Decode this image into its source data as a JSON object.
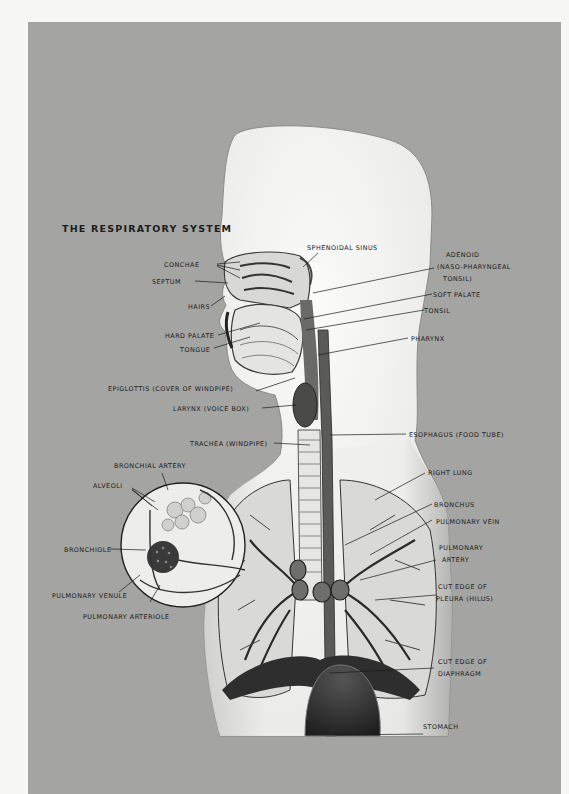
{
  "title": "THE RESPIRATORY SYSTEM",
  "colors": {
    "page_background": "#f7f7f5",
    "panel_background": "#a4a4a2",
    "text": "#1a1a1a",
    "body_fill": "#ececea",
    "tissue_dark": "#2a2a2a"
  },
  "labels": {
    "left": [
      {
        "id": "conchae",
        "text": "CONCHAE"
      },
      {
        "id": "septum",
        "text": "SEPTUM"
      },
      {
        "id": "hairs",
        "text": "HAIRS"
      },
      {
        "id": "hard_palate",
        "text": "HARD PALATE"
      },
      {
        "id": "tongue",
        "text": "TONGUE"
      },
      {
        "id": "epiglottis",
        "text": "EPIGLOTTIS (COVER OF WINDPIPE)"
      },
      {
        "id": "larynx",
        "text": "LARYNX (VOICE BOX)"
      },
      {
        "id": "trachea",
        "text": "TRACHEA (WINDPIPE)"
      },
      {
        "id": "bronchial_artery",
        "text": "BRONCHIAL ARTERY"
      },
      {
        "id": "alveoli",
        "text": "ALVEOLI"
      },
      {
        "id": "bronchiole",
        "text": "BRONCHIOLE"
      },
      {
        "id": "pulmonary_venule",
        "text": "PULMONARY VENULE"
      },
      {
        "id": "pulmonary_arteriole",
        "text": "PULMONARY ARTERIOLE"
      }
    ],
    "top": [
      {
        "id": "sphenoidal_sinus",
        "text": "SPHENOIDAL SINUS"
      }
    ],
    "right": [
      {
        "id": "adenoid",
        "line1": "ADENOID",
        "line2": "(NASO-PHARYNGEAL",
        "line3": "TONSIL)"
      },
      {
        "id": "soft_palate",
        "text": "SOFT PALATE"
      },
      {
        "id": "tonsil",
        "text": "TONSIL"
      },
      {
        "id": "pharynx",
        "text": "PHARYNX"
      },
      {
        "id": "esophagus",
        "text": "ESOPHAGUS (FOOD TUBE)"
      },
      {
        "id": "right_lung",
        "text": "RIGHT LUNG"
      },
      {
        "id": "bronchus",
        "text": "BRONCHUS"
      },
      {
        "id": "pulmonary_vein",
        "text": "PULMONARY VEIN"
      },
      {
        "id": "pulmonary_artery",
        "line1": "PULMONARY",
        "line2": "ARTERY"
      },
      {
        "id": "cut_edge_pleura",
        "line1": "CUT EDGE OF",
        "line2": "PLEURA (HILUS)"
      },
      {
        "id": "cut_edge_diaphragm",
        "line1": "CUT EDGE OF",
        "line2": "DIAPHRAGM"
      },
      {
        "id": "stomach",
        "text": "STOMACH"
      }
    ]
  }
}
